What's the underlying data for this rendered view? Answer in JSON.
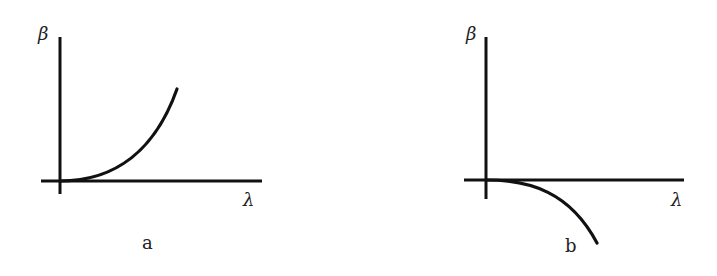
{
  "figure": {
    "panels": [
      {
        "id": "a",
        "caption": "a",
        "y_axis_label": "β",
        "x_axis_label": "λ",
        "curve_description": "convex increasing curve starting at origin, tangent to λ-axis"
      },
      {
        "id": "b",
        "caption": "b",
        "y_axis_label": "β",
        "x_axis_label": "λ",
        "curve_description": "concave decreasing curve starting at origin, tangent to λ-axis"
      }
    ]
  }
}
